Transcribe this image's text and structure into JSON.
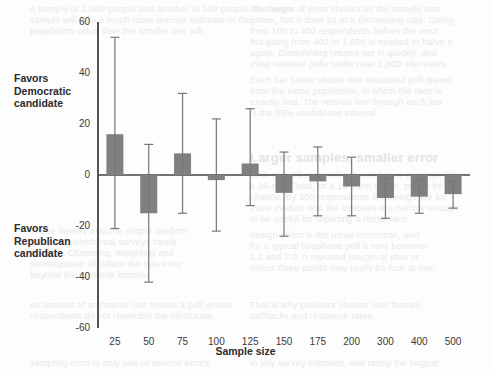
{
  "background_text": {
    "lines": [
      {
        "x": 30,
        "y": 4,
        "t": "a sample of 1,000 people and another of 100 people, the larger",
        "b": false
      },
      {
        "x": 30,
        "y": 15,
        "t": "sample will give a much more precise estimate of the",
        "b": false
      },
      {
        "x": 30,
        "y": 26,
        "t": "population value than the smaller one will.",
        "b": false
      },
      {
        "x": 250,
        "y": 4,
        "t": "the margin of error shrinks as the sample size",
        "b": false
      },
      {
        "x": 250,
        "y": 15,
        "t": "grows, but it does so at a decreasing rate. Going",
        "b": false
      },
      {
        "x": 250,
        "y": 26,
        "t": "from 100 to 400 respondents halves the error,",
        "b": false
      },
      {
        "x": 250,
        "y": 37,
        "t": "but going from 400 to 1,600 is needed to halve it",
        "b": false
      },
      {
        "x": 250,
        "y": 48,
        "t": "again. Diminishing returns set in quickly, and",
        "b": false
      },
      {
        "x": 250,
        "y": 59,
        "t": "most national polls settle near 1,000 interviews.",
        "b": false
      },
      {
        "x": 250,
        "y": 75,
        "t": "Each bar below shows one simulated poll drawn",
        "b": false
      },
      {
        "x": 250,
        "y": 86,
        "t": "from the same population, in which the race is",
        "b": false
      },
      {
        "x": 250,
        "y": 97,
        "t": "exactly tied. The vertical line through each bar",
        "b": false
      },
      {
        "x": 250,
        "y": 108,
        "t": "is the 95% confidence interval.",
        "b": false
      },
      {
        "x": 250,
        "y": 150,
        "t": "Larger samples, smaller error",
        "b": true
      },
      {
        "x": 250,
        "y": 170,
        "t": "With only 25 respondents a tied race can look like",
        "b": false
      },
      {
        "x": 250,
        "y": 181,
        "t": "a 16-point lead, or a 15-point deficit, purely by",
        "b": false
      },
      {
        "x": 250,
        "y": 192,
        "t": "chance. By 500 respondents the swings are far",
        "b": false
      },
      {
        "x": 250,
        "y": 203,
        "t": "more modest and the intervals are narrow enough",
        "b": false
      },
      {
        "x": 250,
        "y": 214,
        "t": "to be useful for reporting a horse race.",
        "b": false
      },
      {
        "x": 30,
        "y": 226,
        "t": "These figures assume simple random",
        "b": false
      },
      {
        "x": 30,
        "y": 237,
        "t": "sampling, which real surveys rarely",
        "b": false
      },
      {
        "x": 30,
        "y": 248,
        "t": "achieve. Clustering, weighting and",
        "b": false
      },
      {
        "x": 30,
        "y": 259,
        "t": "nonresponse all inflate the true error",
        "b": false
      },
      {
        "x": 30,
        "y": 270,
        "t": "beyond the textbook formula.",
        "b": false
      },
      {
        "x": 250,
        "y": 230,
        "t": "design effect is the usual correction, and",
        "b": false
      },
      {
        "x": 250,
        "y": 241,
        "t": "for a typical telephone poll it runs between",
        "b": false
      },
      {
        "x": 250,
        "y": 252,
        "t": "1.2 and 2.0. A reported margin of plus or",
        "b": false
      },
      {
        "x": 250,
        "y": 263,
        "t": "minus three points may really be four or five.",
        "b": false
      },
      {
        "x": 30,
        "y": 300,
        "t": "no amount of arithmetic can rescue a poll whose",
        "b": false
      },
      {
        "x": 30,
        "y": 311,
        "t": "respondents do not resemble the electorate.",
        "b": false
      },
      {
        "x": 250,
        "y": 300,
        "t": "That is why pollsters obsess over frames,",
        "b": false
      },
      {
        "x": 250,
        "y": 311,
        "t": "callbacks and response rates.",
        "b": false
      },
      {
        "x": 30,
        "y": 358,
        "t": "sampling error is only one of several errors",
        "b": false
      },
      {
        "x": 250,
        "y": 358,
        "t": "in any survey estimate, and rarely the largest.",
        "b": false
      }
    ]
  },
  "chart_data": {
    "type": "bar",
    "title": "",
    "subtitle": "",
    "xlabel": "Sample size",
    "ylabel": "",
    "ylim": [
      -60,
      60
    ],
    "xlim_note": "categorical",
    "grid": false,
    "legend": null,
    "categories": [
      "25",
      "50",
      "75",
      "100",
      "125",
      "150",
      "175",
      "200",
      "300",
      "400",
      "500"
    ],
    "y_ticks": [
      60,
      40,
      20,
      0,
      -20,
      -40,
      -60
    ],
    "y_tick_labels": [
      "60",
      "40",
      "20",
      "0",
      "-20",
      "-40",
      "-60"
    ],
    "bar_color": "#808080",
    "error_bar_color": "#777777",
    "axis_color": "#555555",
    "zero_line": 0,
    "values": [
      16,
      -15,
      8.5,
      -2,
      4.5,
      -7,
      -2.5,
      -4.5,
      -9,
      -8.5,
      -7.5
    ],
    "error_high": [
      54,
      12,
      32,
      22,
      26,
      9,
      11,
      7,
      -1.5,
      -2,
      -2.5
    ],
    "error_low": [
      -21,
      -42,
      -15,
      -22,
      -12,
      -24,
      -16,
      -16,
      -17,
      -15,
      -13
    ],
    "annotations": [
      {
        "name": "favors-democratic",
        "text": "Favors\nDemocratic\ncandidate",
        "position": "upper-left"
      },
      {
        "name": "favors-republican",
        "text": "Favors\nRepublican\ncandidate",
        "position": "lower-left"
      }
    ]
  }
}
